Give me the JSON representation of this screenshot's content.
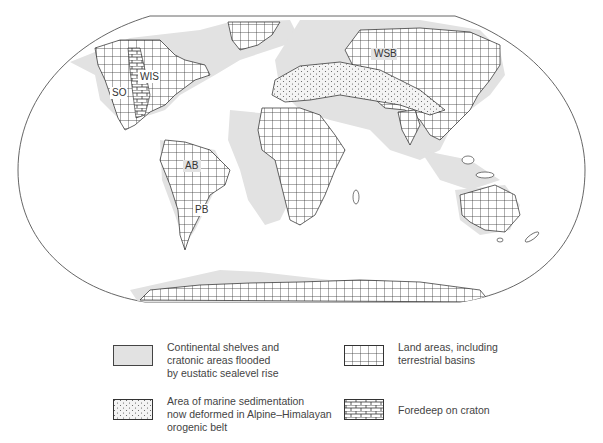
{
  "figure": {
    "type": "paleogeographic world map",
    "projection": "elliptical world map"
  },
  "map_labels": [
    {
      "id": "WIS",
      "text": "WIS",
      "x": 148,
      "y": 80
    },
    {
      "id": "SO",
      "text": "SO",
      "x": 117,
      "y": 96
    },
    {
      "id": "AB",
      "text": "AB",
      "x": 191,
      "y": 169
    },
    {
      "id": "PB",
      "text": "PB",
      "x": 198,
      "y": 213
    },
    {
      "id": "WSB",
      "text": "WSB",
      "x": 380,
      "y": 57
    }
  ],
  "legend": {
    "items": [
      {
        "id": "flooded",
        "pattern": "light-gray-fill",
        "lines": [
          "Continental shelves and",
          "cratonic areas flooded",
          "by eustatic sealevel rise"
        ]
      },
      {
        "id": "land",
        "pattern": "square-grid",
        "lines": [
          "Land areas, including",
          "terrestrial basins"
        ]
      },
      {
        "id": "marine-deformed",
        "pattern": "dotted",
        "lines": [
          "Area of marine sedimentation",
          "now deformed in Alpine–Himalayan",
          "orogenic belt"
        ]
      },
      {
        "id": "foredeep",
        "pattern": "brick",
        "lines": [
          "Foredeep on craton"
        ]
      }
    ]
  },
  "colors": {
    "frame": "#555555",
    "shelf_gray": "#e2e2e2",
    "grid_line": "#333333",
    "text": "#444444"
  }
}
